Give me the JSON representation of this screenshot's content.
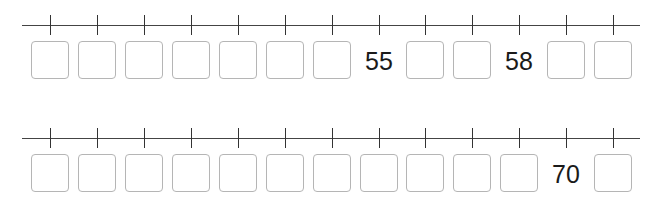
{
  "lines": [
    {
      "name": "number-line-1",
      "cells": [
        {
          "value": "",
          "blank": true
        },
        {
          "value": "",
          "blank": true
        },
        {
          "value": "",
          "blank": true
        },
        {
          "value": "",
          "blank": true
        },
        {
          "value": "",
          "blank": true
        },
        {
          "value": "",
          "blank": true
        },
        {
          "value": "",
          "blank": true
        },
        {
          "value": "55",
          "blank": false
        },
        {
          "value": "",
          "blank": true
        },
        {
          "value": "",
          "blank": true
        },
        {
          "value": "58",
          "blank": false
        },
        {
          "value": "",
          "blank": true
        },
        {
          "value": "",
          "blank": true
        }
      ]
    },
    {
      "name": "number-line-2",
      "cells": [
        {
          "value": "",
          "blank": true
        },
        {
          "value": "",
          "blank": true
        },
        {
          "value": "",
          "blank": true
        },
        {
          "value": "",
          "blank": true
        },
        {
          "value": "",
          "blank": true
        },
        {
          "value": "",
          "blank": true
        },
        {
          "value": "",
          "blank": true
        },
        {
          "value": "",
          "blank": true
        },
        {
          "value": "",
          "blank": true
        },
        {
          "value": "",
          "blank": true
        },
        {
          "value": "",
          "blank": true
        },
        {
          "value": "70",
          "blank": false
        },
        {
          "value": "",
          "blank": true
        }
      ]
    }
  ],
  "layout": {
    "tick_x": [
      50,
      97,
      144,
      191,
      238,
      285,
      332,
      379,
      425,
      472,
      519,
      566,
      613
    ],
    "line_y": [
      25,
      33
    ],
    "box_top": [
      41,
      49
    ]
  }
}
